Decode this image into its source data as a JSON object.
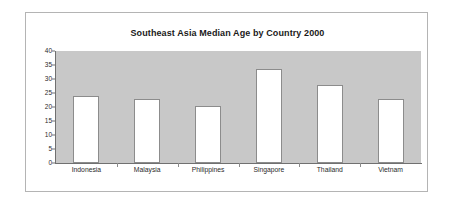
{
  "chart_data": {
    "type": "bar",
    "title": "Southeast Asia Median Age by Country 2000",
    "xlabel": "",
    "ylabel": "",
    "categories": [
      "Indonesia",
      "Malaysia",
      "Philippines",
      "Singapore",
      "Thailand",
      "Vietnam"
    ],
    "values": [
      24,
      23,
      20.5,
      33.5,
      28,
      23
    ],
    "ylim": [
      0,
      40
    ],
    "yticks": [
      0,
      5,
      10,
      15,
      20,
      25,
      30,
      35,
      40
    ],
    "ytick_labels": [
      "0",
      "5",
      "10",
      "15",
      "20",
      "25",
      "30",
      "35",
      "40"
    ],
    "grid": false,
    "legend": null,
    "colors": {
      "bar_fill": "#ffffff",
      "bar_border": "#8c8c8c",
      "plot_background": "#c8c8c8",
      "frame_border": "#b4b4b4",
      "axis": "#707070",
      "text": "#2b2b2b",
      "title_text": "#1a1a1a",
      "page_background": "#ffffff"
    }
  }
}
